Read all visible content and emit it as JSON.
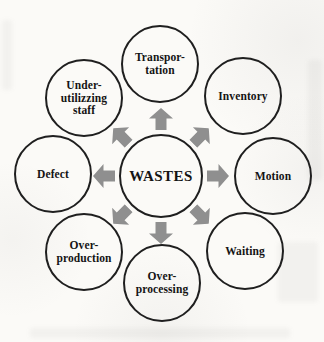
{
  "diagram": {
    "center": {
      "label": "WASTES"
    },
    "nodes": [
      {
        "id": "transportation",
        "label": "Transpor-\ntation",
        "position": "top"
      },
      {
        "id": "inventory",
        "label": "Inventory",
        "position": "top-right"
      },
      {
        "id": "motion",
        "label": "Motion",
        "position": "right"
      },
      {
        "id": "waiting",
        "label": "Waiting",
        "position": "bottom-right"
      },
      {
        "id": "over-processing",
        "label": "Over-\nprocessing",
        "position": "bottom"
      },
      {
        "id": "over-production",
        "label": "Over-\nproduction",
        "position": "bottom-left"
      },
      {
        "id": "defect",
        "label": "Defect",
        "position": "left"
      },
      {
        "id": "under-utilizing-staff",
        "label": "Under-\nutilizzing\nstaff",
        "position": "top-left"
      }
    ],
    "arrows": [
      {
        "icon": "arrow-up-icon",
        "direction": "up"
      },
      {
        "icon": "arrow-up-right-icon",
        "direction": "up-right"
      },
      {
        "icon": "arrow-right-icon",
        "direction": "right"
      },
      {
        "icon": "arrow-down-right-icon",
        "direction": "down-right"
      },
      {
        "icon": "arrow-down-icon",
        "direction": "down"
      },
      {
        "icon": "arrow-down-left-icon",
        "direction": "down-left"
      },
      {
        "icon": "arrow-left-icon",
        "direction": "left"
      },
      {
        "icon": "arrow-up-left-icon",
        "direction": "up-left"
      }
    ],
    "colors": {
      "circle_border": "#1f1f1f",
      "label_text": "#141414",
      "arrow_fill": "#8f8f8f",
      "paper_background": "#fbfaf7"
    }
  }
}
